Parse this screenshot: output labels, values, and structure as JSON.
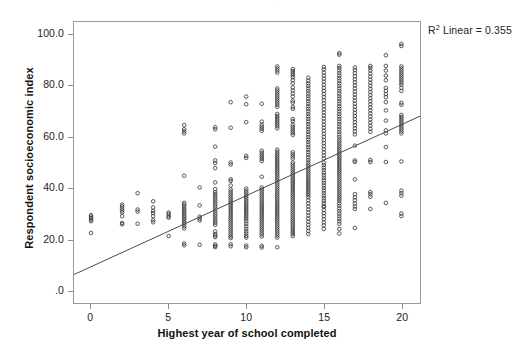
{
  "figure": {
    "ghost_title": "Scatterplot",
    "background_color": "#ffffff",
    "frame_color": "#9a9a9e",
    "marker_color": "#3a3a3a",
    "line_color": "#4a4a4a"
  },
  "annotation": {
    "r2_prefix": "R",
    "r2_superscript": "2",
    "r2_text": " Linear = 0.355"
  },
  "axes": {
    "y_title": "Respondent socioeconomic index",
    "x_title": "Highest year of school completed",
    "y_ticks": [
      "100.0",
      "80.0",
      "60.0",
      "40.0",
      "20.0",
      ".0"
    ],
    "x_ticks": [
      "0",
      "5",
      "10",
      "15",
      "20"
    ]
  },
  "chart_data": {
    "type": "scatter",
    "title": "",
    "xlabel": "Highest year of school completed",
    "ylabel": "Respondent socioeconomic index",
    "xlim": [
      -1.1,
      21.2
    ],
    "ylim": [
      -5.0,
      105.0
    ],
    "xticks": [
      0,
      5,
      10,
      15,
      20
    ],
    "yticks": [
      0,
      20,
      40,
      60,
      80,
      100
    ],
    "ytick_labels": [
      ".0",
      "20.0",
      "40.0",
      "60.0",
      "80.0",
      "100.0"
    ],
    "grid": false,
    "legend": false,
    "r_squared_linear": 0.355,
    "fit_line": {
      "type": "linear",
      "intercept": 9.2,
      "slope": 2.78,
      "x_start": -1.1,
      "x_end": 21.2,
      "color": "#4a4a4a",
      "width": 1
    },
    "marker": {
      "shape": "open-circle",
      "diameter_px": 3.6,
      "edge_color": "#3a3a3a",
      "fill": "none",
      "edge_width": 0.85
    },
    "columns": [
      {
        "x": 0,
        "y": [
          22.4,
          27.0,
          27.6,
          28.2,
          28.8,
          29.4
        ]
      },
      {
        "x": 2,
        "y": [
          25.8,
          26.3,
          29.0,
          30.5,
          31.2,
          32.0,
          32.8,
          33.5
        ]
      },
      {
        "x": 3,
        "y": [
          26.0,
          30.8,
          31.6,
          38.0
        ]
      },
      {
        "x": 4,
        "y": [
          26.6,
          27.4,
          29.0,
          30.2,
          31.0,
          32.4,
          34.8
        ]
      },
      {
        "x": 5,
        "y": [
          21.2,
          28.4,
          29.0,
          29.8,
          30.4
        ]
      },
      {
        "x": 6,
        "y": [
          17.6,
          18.3,
          24.2,
          25.0,
          25.8,
          26.5,
          27.2,
          27.9,
          28.6,
          29.3,
          30.0,
          30.7,
          31.4,
          32.1,
          32.9,
          33.6,
          34.2,
          44.8,
          61.4,
          62.2,
          63.0,
          64.6
        ]
      },
      {
        "x": 7,
        "y": [
          17.8,
          27.3,
          28.0,
          28.8,
          33.2,
          40.2
        ]
      },
      {
        "x": 8,
        "y": [
          16.9,
          17.4,
          17.9,
          20.8,
          21.4,
          22.0,
          23.0,
          25.6,
          26.4,
          27.2,
          28.0,
          28.8,
          29.6,
          30.4,
          31.2,
          32.0,
          32.8,
          33.6,
          34.4,
          35.2,
          36.0,
          36.8,
          37.6,
          38.4,
          39.6,
          42.2,
          47.8,
          49.8,
          50.8,
          56.2,
          63.0,
          63.8
        ]
      },
      {
        "x": 9,
        "y": [
          17.2,
          18.0,
          20.4,
          21.0,
          21.8,
          22.6,
          23.4,
          24.2,
          25.0,
          25.8,
          26.6,
          27.4,
          28.2,
          29.0,
          29.8,
          30.6,
          31.4,
          32.2,
          33.0,
          33.8,
          34.6,
          35.4,
          36.2,
          37.0,
          37.8,
          38.6,
          39.4,
          41.0,
          42.8,
          43.4,
          49.2,
          50.0,
          63.6,
          73.6
        ]
      },
      {
        "x": 10,
        "y": [
          16.8,
          17.5,
          20.6,
          21.3,
          22.2,
          23.0,
          24.0,
          25.0,
          26.0,
          27.0,
          27.8,
          28.6,
          29.4,
          30.2,
          31.0,
          31.8,
          32.6,
          33.4,
          34.2,
          35.0,
          35.8,
          36.6,
          37.4,
          38.2,
          39.0,
          39.8,
          51.8,
          52.6,
          65.8,
          72.8,
          75.8
        ]
      },
      {
        "x": 11,
        "y": [
          16.7,
          17.4,
          21.0,
          21.8,
          22.6,
          23.4,
          24.2,
          25.0,
          25.8,
          26.6,
          27.4,
          28.2,
          29.0,
          29.8,
          30.6,
          31.4,
          32.2,
          33.0,
          33.8,
          34.6,
          35.4,
          36.2,
          37.0,
          37.8,
          38.6,
          39.4,
          40.2,
          44.4,
          50.6,
          51.4,
          52.2,
          53.0,
          53.8,
          54.6,
          62.4,
          63.2,
          64.0,
          64.8,
          66.0,
          73.0
        ]
      },
      {
        "x": 12,
        "y": [
          16.8,
          20.6,
          21.4,
          22.2,
          23.0,
          23.8,
          24.6,
          25.4,
          26.2,
          27.0,
          27.8,
          28.6,
          29.4,
          30.2,
          31.0,
          31.8,
          32.6,
          33.4,
          34.2,
          35.0,
          35.8,
          36.6,
          37.4,
          38.2,
          39.0,
          39.8,
          40.6,
          41.4,
          42.2,
          43.0,
          43.8,
          44.6,
          45.4,
          46.2,
          47.0,
          47.8,
          48.6,
          49.4,
          50.2,
          51.0,
          51.8,
          52.6,
          53.4,
          54.2,
          55.0,
          63.4,
          64.2,
          65.0,
          65.8,
          66.6,
          67.4,
          68.2,
          69.0,
          71.8,
          72.6,
          73.4,
          74.2,
          75.0,
          75.8,
          76.6,
          77.4,
          78.2,
          79.0,
          85.2,
          86.0,
          86.8,
          87.6
        ]
      },
      {
        "x": 13,
        "y": [
          21.2,
          22.0,
          22.8,
          23.6,
          24.4,
          25.2,
          26.0,
          26.8,
          27.6,
          28.4,
          29.2,
          30.0,
          30.8,
          31.6,
          32.4,
          33.2,
          34.0,
          34.8,
          35.6,
          36.4,
          37.2,
          38.0,
          38.8,
          39.6,
          40.4,
          41.2,
          42.0,
          42.8,
          43.6,
          44.4,
          45.2,
          46.0,
          46.8,
          47.6,
          48.4,
          49.2,
          50.0,
          51.6,
          52.4,
          53.2,
          54.0,
          60.8,
          61.6,
          62.4,
          63.2,
          64.0,
          64.8,
          66.2,
          67.0,
          71.0,
          71.8,
          73.4,
          74.2,
          75.8,
          77.0,
          78.2,
          79.4,
          81.0,
          82.2,
          83.4,
          84.2,
          85.0,
          85.8,
          86.6
        ]
      },
      {
        "x": 14,
        "y": [
          22.0,
          23.2,
          24.4,
          25.6,
          26.8,
          28.0,
          29.2,
          30.4,
          31.6,
          32.8,
          34.0,
          35.2,
          36.4,
          37.2,
          38.0,
          38.8,
          39.6,
          40.4,
          41.2,
          42.0,
          42.8,
          43.6,
          44.4,
          45.2,
          46.0,
          46.8,
          47.6,
          48.4,
          49.2,
          50.0,
          51.0,
          52.0,
          53.0,
          54.0,
          55.0,
          56.0,
          57.0,
          58.0,
          59.0,
          60.0,
          61.0,
          62.0,
          63.0,
          64.0,
          65.0,
          66.0,
          67.0,
          68.0,
          69.0,
          70.0,
          71.0,
          72.0,
          73.0,
          74.0,
          75.0,
          76.0,
          77.0,
          78.0,
          79.0,
          80.0,
          81.0,
          82.0,
          83.2
        ]
      },
      {
        "x": 15,
        "y": [
          24.0,
          25.4,
          26.6,
          27.8,
          29.0,
          30.2,
          31.4,
          32.6,
          33.0,
          34.0,
          35.0,
          36.0,
          37.0,
          38.0,
          39.0,
          40.0,
          41.0,
          42.0,
          43.0,
          44.0,
          45.0,
          46.0,
          47.0,
          48.0,
          49.0,
          50.0,
          51.6,
          52.8,
          54.0,
          55.2,
          56.4,
          57.6,
          58.8,
          60.0,
          61.2,
          62.4,
          63.6,
          64.8,
          66.0,
          67.2,
          68.4,
          69.6,
          70.8,
          72.0,
          73.2,
          74.4,
          75.6,
          76.8,
          78.0,
          79.2,
          80.4,
          81.6,
          82.8,
          84.0,
          85.2,
          86.4,
          87.4
        ]
      },
      {
        "x": 16,
        "y": [
          22.2,
          24.0,
          26.0,
          27.0,
          28.0,
          29.0,
          30.0,
          31.0,
          32.0,
          33.0,
          34.0,
          35.0,
          35.8,
          36.6,
          37.4,
          38.2,
          39.0,
          39.8,
          40.6,
          41.4,
          42.2,
          43.0,
          43.8,
          44.6,
          45.4,
          46.2,
          47.0,
          47.8,
          48.6,
          49.4,
          50.2,
          51.0,
          51.8,
          52.6,
          53.4,
          54.2,
          55.0,
          55.8,
          56.6,
          57.4,
          58.2,
          59.0,
          60.0,
          61.0,
          62.0,
          63.0,
          64.0,
          65.0,
          66.0,
          67.0,
          68.0,
          69.0,
          70.0,
          71.0,
          72.0,
          73.0,
          74.0,
          75.0,
          76.0,
          77.0,
          78.0,
          79.0,
          80.0,
          81.0,
          82.0,
          83.0,
          84.0,
          85.0,
          86.0,
          87.0,
          87.8,
          92.2,
          92.8
        ]
      },
      {
        "x": 17,
        "y": [
          24.4,
          31.8,
          32.8,
          34.0,
          35.2,
          36.4,
          37.6,
          43.4,
          50.2,
          50.8,
          56.6,
          61.0,
          62.2,
          63.4,
          64.6,
          65.8,
          67.0,
          68.2,
          69.4,
          70.6,
          71.8,
          73.0,
          74.2,
          75.4,
          76.6,
          77.8,
          79.0,
          80.2,
          81.4,
          82.6,
          83.8,
          85.0,
          86.2,
          87.2
        ]
      },
      {
        "x": 18,
        "y": [
          31.8,
          36.6,
          37.6,
          38.4,
          50.2,
          51.0,
          62.0,
          63.2,
          64.4,
          65.6,
          66.8,
          68.0,
          69.2,
          70.4,
          71.6,
          72.8,
          74.0,
          75.2,
          76.4,
          77.6,
          78.8,
          80.0,
          81.2,
          82.4,
          83.6,
          84.8,
          86.0,
          87.0,
          87.8
        ]
      },
      {
        "x": 19,
        "y": [
          34.2,
          50.2,
          56.0,
          61.4,
          62.6,
          66.4,
          70.4,
          73.6,
          75.6,
          76.8,
          78.0,
          79.2,
          82.2,
          84.0,
          86.0,
          87.8,
          92.0
        ]
      },
      {
        "x": 20,
        "y": [
          29.0,
          30.0,
          37.0,
          38.0,
          39.0,
          50.4,
          61.4,
          62.2,
          63.0,
          63.8,
          64.6,
          65.4,
          66.2,
          67.0,
          67.8,
          68.6,
          72.6,
          73.4,
          78.0,
          79.2,
          80.4,
          81.2,
          82.0,
          82.8,
          83.6,
          84.4,
          85.2,
          86.0,
          86.8,
          87.6,
          95.6,
          96.4
        ]
      }
    ]
  }
}
